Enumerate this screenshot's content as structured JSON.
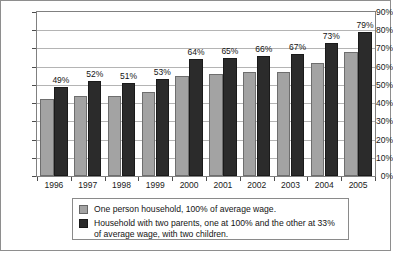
{
  "chart_data": {
    "type": "bar",
    "title": "",
    "xlabel": "",
    "ylabel": "",
    "ylim": [
      0,
      90
    ],
    "grid": true,
    "legend_position": "bottom",
    "categories": [
      "1996",
      "1997",
      "1998",
      "1999",
      "2000",
      "2001",
      "2002",
      "2003",
      "2004",
      "2005"
    ],
    "ytick_labels": [
      "90%",
      "80%",
      "70%",
      "60%",
      "50%",
      "40%",
      "30%",
      "20%",
      "10%",
      "0%"
    ],
    "ytick_values": [
      90,
      80,
      70,
      60,
      50,
      40,
      30,
      20,
      10,
      0
    ],
    "series": [
      {
        "name": "One person household, 100% of average wage.",
        "color": "#a3a3a3",
        "values": [
          42,
          44,
          44,
          46,
          55,
          56,
          57,
          57,
          62,
          68
        ],
        "labels": [
          "",
          "",
          "",
          "",
          "",
          "",
          "",
          "",
          "",
          ""
        ]
      },
      {
        "name": "Household with two parents, one at  100% and the other at  33% of average wage, with two children.",
        "color": "#2b2b2b",
        "values": [
          49,
          52,
          51,
          53,
          64,
          65,
          66,
          67,
          73,
          79
        ],
        "labels": [
          "49%",
          "52%",
          "51%",
          "53%",
          "64%",
          "65%",
          "66%",
          "67%",
          "73%",
          "79%"
        ]
      }
    ]
  },
  "legend": {
    "items": [
      {
        "label": "One person household, 100% of average wage.",
        "swatch": "light"
      },
      {
        "label": "Household with two parents, one at  100% and the other at  33% of average wage, with two children.",
        "swatch": "dark"
      }
    ]
  }
}
